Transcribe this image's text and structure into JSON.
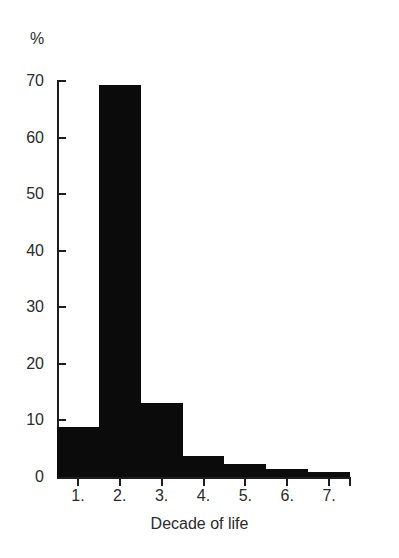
{
  "chart_data": {
    "type": "bar",
    "title": "",
    "subtitle": "",
    "xlabel": "Decade of life",
    "ylabel": "%",
    "categories": [
      "1.",
      "2.",
      "3.",
      "4.",
      "5.",
      "6.",
      "7."
    ],
    "values": [
      8.8,
      69.3,
      13.0,
      3.8,
      2.3,
      1.4,
      0.9
    ],
    "series": [
      {
        "name": "Percentage of patients",
        "values": [
          8.8,
          69.3,
          13.0,
          3.8,
          2.3,
          1.4,
          0.9
        ]
      }
    ],
    "ylim": [
      0,
      70
    ],
    "xlim": [
      0.5,
      7.5
    ],
    "yticks": [
      0,
      10,
      20,
      30,
      40,
      50,
      60,
      70
    ],
    "ytick_labels": [
      "0",
      "10",
      "20",
      "30",
      "40",
      "50",
      "60",
      "70"
    ],
    "xticks": [
      1,
      2,
      3,
      4,
      5,
      6,
      7
    ],
    "xtick_labels": [
      "1.",
      "2.",
      "3.",
      "4.",
      "5.",
      "6.",
      "7."
    ],
    "grid": false,
    "legend": null,
    "legend_position": "none",
    "bar_style": "histogram-contiguous",
    "bar_color": "#0b0b0b",
    "axis_color": "#1d1d1d",
    "background_color": "#ffffff",
    "annotations": []
  },
  "axes": {
    "y_unit_label": "%",
    "x_title": "Decade of life"
  }
}
